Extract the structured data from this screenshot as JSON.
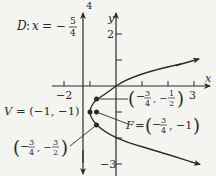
{
  "figure": {
    "equation_implied": "(y + 1)^2 = x + 1",
    "directrix_label": {
      "prefix": "D: x = −",
      "num": "5",
      "den": "4"
    },
    "axes": {
      "x_label": "x",
      "y_label": "y",
      "x_ticks": [
        {
          "value": -2,
          "label": "−2"
        },
        {
          "value": -1,
          "label": ""
        },
        {
          "value": 1,
          "label": ""
        },
        {
          "value": 2,
          "label": ""
        },
        {
          "value": 3,
          "label": "3"
        }
      ],
      "y_ticks": [
        {
          "value": 2,
          "label": "2"
        },
        {
          "value": 1,
          "label": ""
        },
        {
          "value": -1,
          "label": ""
        },
        {
          "value": -2,
          "label": ""
        },
        {
          "value": -3,
          "label": "−3"
        }
      ],
      "top_label": "4"
    },
    "vertex_label": "V = (−1, −1)",
    "focus_label": {
      "prefix": "F = ",
      "x_num": "3",
      "x_den": "4",
      "y": "−1"
    },
    "point_upper": {
      "x_num": "3",
      "x_den": "4",
      "y_num": "1",
      "y_den": "2"
    },
    "point_lower": {
      "x_num": "3",
      "x_den": "4",
      "y_num": "3",
      "y_den": "2"
    },
    "colors": {
      "ink": "#2a2a2a",
      "background": "#f4f4f1"
    }
  }
}
